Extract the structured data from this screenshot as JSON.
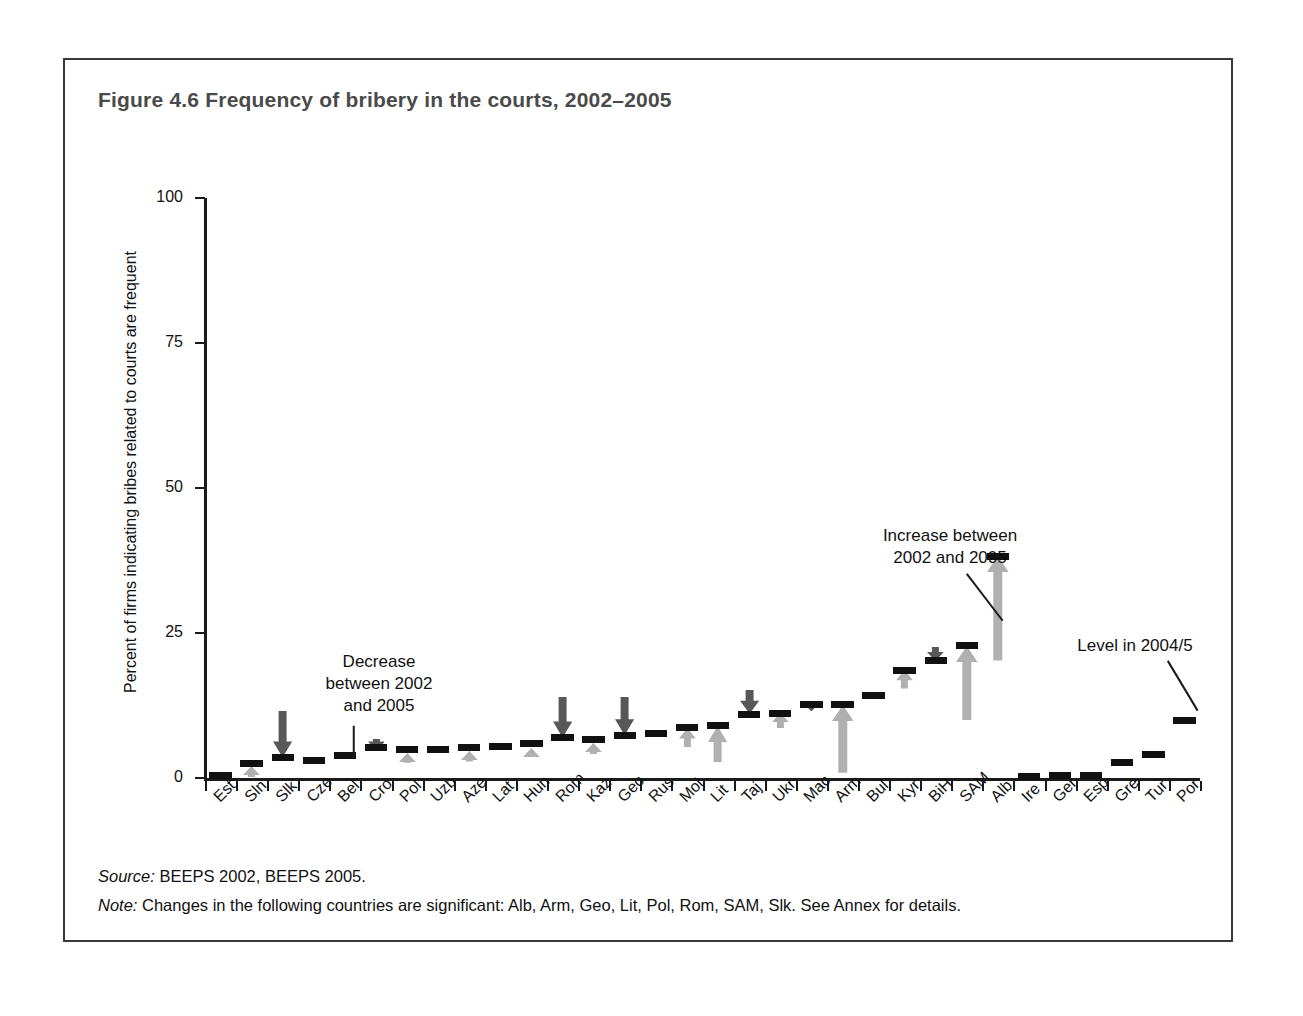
{
  "figure": {
    "title": "Figure 4.6  Frequency of bribery in the courts, 2002–2005",
    "source_label": "Source:",
    "source_text": " BEEPS 2002, BEEPS 2005.",
    "note_label": "Note:",
    "note_text": " Changes in the following countries are significant: Alb, Arm, Geo, Lit, Pol, Rom, SAM, Slk. See Annex for details."
  },
  "annotations": [
    {
      "name": "decrease-annotation",
      "text": "Decrease\nbetween 2002\nand 2005",
      "x": 224,
      "y": 591,
      "width": 180,
      "leader": {
        "x1": 289,
        "y1": 665,
        "x2": 289,
        "y2": 698
      }
    },
    {
      "name": "increase-annotation",
      "text": "Increase between\n2002 and 2005",
      "x": 770,
      "y": 465,
      "width": 230,
      "leader": {
        "x1": 902,
        "y1": 513,
        "x2": 938,
        "y2": 560
      }
    },
    {
      "name": "level-annotation",
      "text": "Level in 2004/5",
      "x": 970,
      "y": 575,
      "width": 200,
      "leader": {
        "x1": 1103,
        "y1": 600,
        "x2": 1133,
        "y2": 650
      }
    }
  ],
  "colors": {
    "level_bar": "#111111",
    "decrease_arrow": "#585858",
    "increase_arrow": "#b0b0b0",
    "axis": "#1a1a1a",
    "title": "#4a4a4a",
    "frame": "#3a3a3a"
  },
  "chart_data": {
    "type": "bar",
    "title": "Figure 4.6  Frequency of bribery in the courts, 2002–2005",
    "xlabel": "",
    "ylabel": "Percent of firms indicating bribes related to courts are frequent",
    "ylim": [
      0,
      100
    ],
    "yticks": [
      0,
      25,
      50,
      75,
      100
    ],
    "ytick_labels": [
      "0",
      "25",
      "50",
      "75",
      "100"
    ],
    "grid": false,
    "legend_position": "none",
    "categories": [
      "Est",
      "Sln",
      "Slk",
      "Cze",
      "Bel",
      "Cro",
      "Pol",
      "Uzb",
      "Aze",
      "Lat",
      "Hun",
      "Rom",
      "Kaz",
      "Geo",
      "Rus",
      "Mol",
      "Lit",
      "Taj",
      "Ukr",
      "Mac",
      "Arm",
      "Bul",
      "Kyr",
      "BiH",
      "SAM",
      "Alb",
      "Ire",
      "Ger",
      "Esp",
      "Gre",
      "Tur",
      "Por"
    ],
    "series": [
      {
        "name": "Level in 2004/5",
        "values": [
          0.5,
          2.5,
          3.6,
          3.1,
          3.8,
          5.2,
          5.0,
          5.0,
          5.2,
          5.4,
          6.0,
          7.0,
          6.6,
          7.4,
          7.7,
          8.7,
          9.0,
          11.0,
          11.2,
          12.6,
          12.6,
          14.2,
          18.6,
          20.2,
          22.8,
          38.2,
          0.3,
          0.5,
          0.5,
          2.6,
          4.0,
          10.0
        ]
      },
      {
        "name": "2002 level (arrow origin)",
        "values": [
          null,
          0.6,
          11.6,
          null,
          null,
          7.2,
          3.3,
          null,
          3.4,
          null,
          4.4,
          14.0,
          4.7,
          14.0,
          null,
          5.4,
          2.8,
          15.1,
          8.6,
          13.9,
          0.9,
          null,
          15.4,
          22.6,
          10.0,
          20.2,
          null,
          null,
          null,
          null,
          null,
          null
        ]
      }
    ],
    "changes": [
      {
        "country": "Est",
        "direction": "none"
      },
      {
        "country": "Sln",
        "direction": "increase",
        "from": 0.6,
        "to": 2.5
      },
      {
        "country": "Slk",
        "direction": "decrease",
        "from": 11.6,
        "to": 3.6
      },
      {
        "country": "Cze",
        "direction": "none"
      },
      {
        "country": "Bel",
        "direction": "none"
      },
      {
        "country": "Cro",
        "direction": "decrease",
        "from": 7.2,
        "to": 5.2
      },
      {
        "country": "Pol",
        "direction": "increase",
        "from": 3.3,
        "to": 5.0
      },
      {
        "country": "Uzb",
        "direction": "none"
      },
      {
        "country": "Aze",
        "direction": "increase",
        "from": 3.4,
        "to": 5.2
      },
      {
        "country": "Lat",
        "direction": "none"
      },
      {
        "country": "Hun",
        "direction": "increase",
        "from": 4.4,
        "to": 6.0
      },
      {
        "country": "Rom",
        "direction": "decrease",
        "from": 14.0,
        "to": 7.0
      },
      {
        "country": "Kaz",
        "direction": "increase",
        "from": 4.7,
        "to": 6.6
      },
      {
        "country": "Geo",
        "direction": "decrease",
        "from": 14.0,
        "to": 7.4
      },
      {
        "country": "Rus",
        "direction": "none"
      },
      {
        "country": "Mol",
        "direction": "increase",
        "from": 5.4,
        "to": 8.7
      },
      {
        "country": "Lit",
        "direction": "increase",
        "from": 2.8,
        "to": 9.0
      },
      {
        "country": "Taj",
        "direction": "decrease",
        "from": 15.1,
        "to": 11.0
      },
      {
        "country": "Ukr",
        "direction": "increase",
        "from": 8.6,
        "to": 11.2
      },
      {
        "country": "Mac",
        "direction": "decrease",
        "from": 13.9,
        "to": 12.6
      },
      {
        "country": "Arm",
        "direction": "increase",
        "from": 0.9,
        "to": 12.6
      },
      {
        "country": "Bul",
        "direction": "none"
      },
      {
        "country": "Kyr",
        "direction": "increase",
        "from": 15.4,
        "to": 18.6
      },
      {
        "country": "BiH",
        "direction": "decrease",
        "from": 22.6,
        "to": 20.2
      },
      {
        "country": "SAM",
        "direction": "increase",
        "from": 10.0,
        "to": 22.8
      },
      {
        "country": "Alb",
        "direction": "increase",
        "from": 20.2,
        "to": 38.2
      },
      {
        "country": "Ire",
        "direction": "none"
      },
      {
        "country": "Ger",
        "direction": "none"
      },
      {
        "country": "Esp",
        "direction": "none"
      },
      {
        "country": "Gre",
        "direction": "none"
      },
      {
        "country": "Tur",
        "direction": "none"
      },
      {
        "country": "Por",
        "direction": "none"
      }
    ],
    "annotations": [
      "Decrease between 2002 and 2005",
      "Increase between 2002 and 2005",
      "Level in 2004/5"
    ]
  }
}
